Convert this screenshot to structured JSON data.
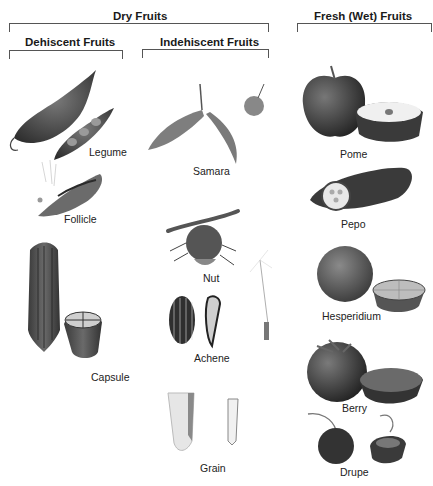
{
  "headers": {
    "dry": "Dry Fruits",
    "dehiscent": "Dehiscent Fruits",
    "indehiscent": "Indehiscent Fruits",
    "fresh": "Fresh (Wet) Fruits"
  },
  "dehiscent_fruits": [
    {
      "label": "Legume"
    },
    {
      "label": "Follicle"
    },
    {
      "label": "Capsule"
    }
  ],
  "indehiscent_fruits": [
    {
      "label": "Samara"
    },
    {
      "label": "Nut"
    },
    {
      "label": "Achene"
    },
    {
      "label": "Grain"
    }
  ],
  "fresh_fruits": [
    {
      "label": "Pome"
    },
    {
      "label": "Pepo"
    },
    {
      "label": "Hesperidium"
    },
    {
      "label": "Berry"
    },
    {
      "label": "Drupe"
    }
  ]
}
